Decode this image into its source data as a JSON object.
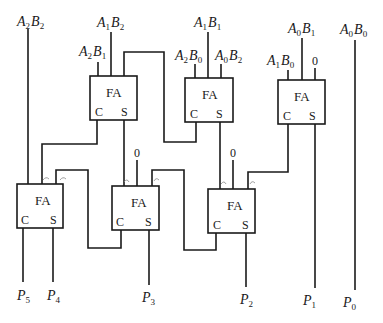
{
  "diagram": {
    "block_label": "FA",
    "carry_port": "C",
    "sum_port": "S",
    "zero": "0",
    "inputs": [
      {
        "id": "a2b2",
        "a": "A",
        "ai": "2",
        "b": "B",
        "bi": "2"
      },
      {
        "id": "a1b2",
        "a": "A",
        "ai": "1",
        "b": "B",
        "bi": "2"
      },
      {
        "id": "a2b1",
        "a": "A",
        "ai": "2",
        "b": "B",
        "bi": "1"
      },
      {
        "id": "a1b1",
        "a": "A",
        "ai": "1",
        "b": "B",
        "bi": "1"
      },
      {
        "id": "a2b0",
        "a": "A",
        "ai": "2",
        "b": "B",
        "bi": "0"
      },
      {
        "id": "a0b2",
        "a": "A",
        "ai": "0",
        "b": "B",
        "bi": "2"
      },
      {
        "id": "a0b1",
        "a": "A",
        "ai": "0",
        "b": "B",
        "bi": "1"
      },
      {
        "id": "a1b0",
        "a": "A",
        "ai": "1",
        "b": "B",
        "bi": "0"
      },
      {
        "id": "a0b0",
        "a": "A",
        "ai": "0",
        "b": "B",
        "bi": "0"
      }
    ],
    "outputs": [
      {
        "id": "p5",
        "p": "P",
        "pi": "5"
      },
      {
        "id": "p4",
        "p": "P",
        "pi": "4"
      },
      {
        "id": "p3",
        "p": "P",
        "pi": "3"
      },
      {
        "id": "p2",
        "p": "P",
        "pi": "2"
      },
      {
        "id": "p1",
        "p": "P",
        "pi": "1"
      },
      {
        "id": "p0",
        "p": "P",
        "pi": "0"
      }
    ],
    "adders": [
      {
        "id": "fa-top-left"
      },
      {
        "id": "fa-top-middle"
      },
      {
        "id": "fa-top-right"
      },
      {
        "id": "fa-bottom-left"
      },
      {
        "id": "fa-bottom-middle"
      },
      {
        "id": "fa-bottom-right"
      }
    ]
  }
}
